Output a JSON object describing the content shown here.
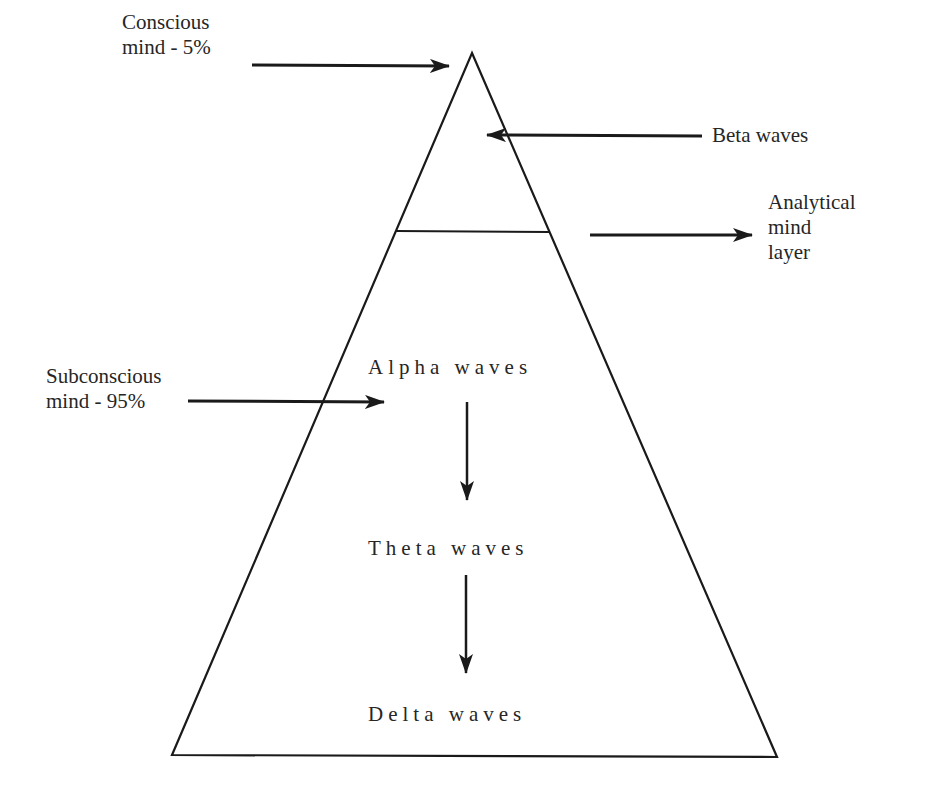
{
  "diagram": {
    "colors": {
      "stroke": "#1a1a1a",
      "text": "#262626",
      "background": "#ffffff"
    },
    "left_labels": {
      "conscious": "Conscious\nmind - 5%",
      "subconscious": "Subconscious\nmind - 95%"
    },
    "right_labels": {
      "beta": "Beta waves",
      "analytical": "Analytical\nmind\nlayer"
    },
    "inner_labels": {
      "alpha": "Alpha waves",
      "theta": "Theta waves",
      "delta": "Delta waves"
    },
    "layers": [
      {
        "name": "Conscious mind",
        "share": "5%",
        "waves": "Beta waves"
      },
      {
        "name": "Subconscious mind",
        "share": "95%",
        "waves": [
          "Alpha waves",
          "Theta waves",
          "Delta waves"
        ]
      }
    ]
  }
}
